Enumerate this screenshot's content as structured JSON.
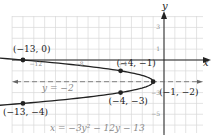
{
  "chart_data": {
    "type": "line",
    "title": "",
    "equation": "x = −3y² − 12y − 13",
    "axis_of_symmetry_label": "y = −2",
    "xlabel": "x",
    "ylabel": "y",
    "xlim": [
      -14,
      3
    ],
    "ylim": [
      -7,
      5
    ],
    "grid": true,
    "x_tick_labels": [
      {
        "value": -12,
        "text": "−12"
      },
      {
        "value": -8,
        "text": "−8"
      },
      {
        "value": -4,
        "text": "−4"
      }
    ],
    "y_tick_labels": [
      {
        "value": 3,
        "text": "3"
      },
      {
        "value": 1,
        "text": "1"
      },
      {
        "value": -3,
        "text": "−3"
      },
      {
        "value": -5,
        "text": "−5"
      }
    ],
    "series": [
      {
        "name": "x = −3y² − 12y − 13",
        "kind": "parabola",
        "points": [
          {
            "x": -13,
            "y": 0,
            "label": "(−13, 0)"
          },
          {
            "x": -4,
            "y": -1,
            "label": "(−4, −1)"
          },
          {
            "x": -1,
            "y": -2,
            "label": "(−1, −2)"
          },
          {
            "x": -4,
            "y": -3,
            "label": "(−4, −3)"
          },
          {
            "x": -13,
            "y": -4,
            "label": "(−13, −4)"
          }
        ]
      }
    ],
    "annotations": [
      {
        "text": "y = −2",
        "kind": "dashed-line",
        "y": -2
      },
      {
        "text": "x = −3y² − 12y − 13",
        "kind": "equation-label"
      }
    ],
    "colors": {
      "curve": "#222222",
      "grid": "#d8d8d8",
      "axes": "#222222",
      "dashed": "#666666",
      "label_muted": "#888888"
    }
  }
}
